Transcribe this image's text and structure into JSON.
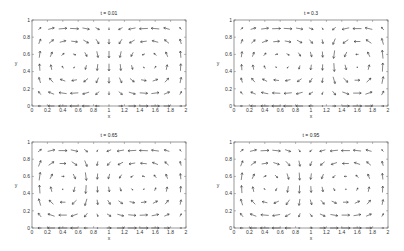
{
  "chart_data": [
    {
      "type": "quiver",
      "title": "t = 0.01",
      "xlabel": "x",
      "ylabel": "y",
      "xlim": [
        0,
        2
      ],
      "ylim": [
        0,
        1
      ],
      "xticks": [
        "0",
        "0.2",
        "0.4",
        "0.6",
        "0.8",
        "1",
        "1.2",
        "1.4",
        "1.6",
        "1.8",
        "2"
      ],
      "yticks": [
        "0",
        "0.2",
        "0.4",
        "0.6",
        "0.8",
        "1"
      ],
      "grid": false,
      "divider_x": 1.0,
      "description": "Two counter-rotating cells; top row flows toward center, bottom rows flow outward"
    },
    {
      "type": "quiver",
      "title": "t = 0.3",
      "xlabel": "x",
      "ylabel": "y",
      "xlim": [
        0,
        2
      ],
      "ylim": [
        0,
        1
      ],
      "xticks": [
        "0",
        "0.2",
        "0.4",
        "0.6",
        "0.8",
        "1",
        "1.2",
        "1.4",
        "1.6",
        "1.8",
        "2"
      ],
      "yticks": [
        "0",
        "0.2",
        "0.4",
        "0.6",
        "0.8",
        "1"
      ],
      "grid": false,
      "divider_x": 1.2,
      "description": "Cell boundary shifted right toward x=1.2"
    },
    {
      "type": "quiver",
      "title": "t = 0.65",
      "xlabel": "x",
      "ylabel": "y",
      "xlim": [
        0,
        2
      ],
      "ylim": [
        0,
        1
      ],
      "xticks": [
        "0",
        "0.2",
        "0.4",
        "0.6",
        "0.8",
        "1",
        "1.2",
        "1.4",
        "1.6",
        "1.8",
        "2"
      ],
      "yticks": [
        "0",
        "0.2",
        "0.4",
        "0.6",
        "0.8",
        "1"
      ],
      "grid": false,
      "divider_x": 0.8,
      "description": "Cell boundary shifted left toward x=0.8"
    },
    {
      "type": "quiver",
      "title": "t = 0.95",
      "xlabel": "x",
      "ylabel": "y",
      "xlim": [
        0,
        2
      ],
      "ylim": [
        0,
        1
      ],
      "xticks": [
        "0",
        "0.2",
        "0.4",
        "0.6",
        "0.8",
        "1",
        "1.2",
        "1.4",
        "1.6",
        "1.8",
        "2"
      ],
      "yticks": [
        "0",
        "0.2",
        "0.4",
        "0.6",
        "0.8",
        "1"
      ],
      "grid": false,
      "divider_x": 0.9,
      "description": "Cell boundary near x=0.9"
    }
  ],
  "grid_sampling": {
    "x": [
      0.1,
      0.25,
      0.4,
      0.55,
      0.7,
      0.85,
      1.0,
      1.15,
      1.3,
      1.45,
      1.6,
      1.75,
      1.93
    ],
    "y": [
      0.0,
      0.15,
      0.3,
      0.45,
      0.6,
      0.75,
      0.9
    ]
  },
  "colors": {
    "axes": "#555555",
    "arrow": "#333333",
    "background": "#ffffff"
  },
  "panels": [
    {
      "title": "t = 0.01"
    },
    {
      "title": "t = 0.3"
    },
    {
      "title": "t = 0.65"
    },
    {
      "title": "t = 0.95"
    }
  ]
}
